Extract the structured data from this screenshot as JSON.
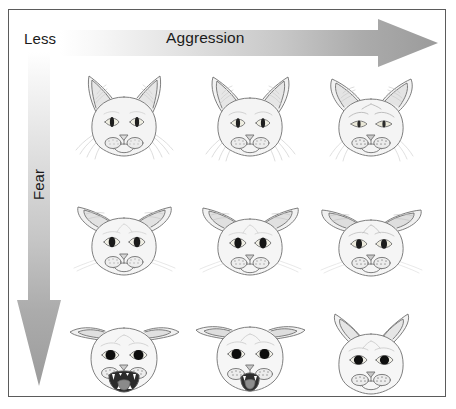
{
  "figure": {
    "type": "cat-emotion-matrix"
  },
  "axes": {
    "horizontal": {
      "start_label": "Less",
      "axis_label": "Aggression",
      "direction": "left-to-right",
      "arrow_name": "aggression-arrow"
    },
    "vertical": {
      "axis_label": "Fear",
      "direction": "top-to-bottom",
      "arrow_name": "fear-arrow"
    }
  },
  "colors": {
    "border": "#5b5b5b",
    "background": "#ffffff",
    "arrow_light": "#fdfdfd",
    "arrow_dark": "#9a9a9a",
    "text": "#1b1b1b",
    "cat_outline": "#6e6e6e",
    "cat_fill": "#f4f4f4",
    "pupil_dark": "#1a1a1a",
    "iris_light": "#eceade"
  },
  "grid": {
    "rows": 3,
    "cols": 3,
    "row_labels": [
      "low-fear",
      "medium-fear",
      "high-fear"
    ],
    "col_labels": [
      "low-aggression",
      "medium-aggression",
      "high-aggression"
    ],
    "cells": [
      {
        "name": "cat-low-fear-low-aggression",
        "row": 0,
        "col": 0,
        "ears": "upright-forward",
        "pupils": "narrow-slit",
        "mouth": "closed",
        "whiskers": "relaxed-spread"
      },
      {
        "name": "cat-low-fear-medium-aggression",
        "row": 0,
        "col": 1,
        "ears": "upright-slightly-rotated",
        "pupils": "narrow-slit",
        "mouth": "closed",
        "whiskers": "forward"
      },
      {
        "name": "cat-low-fear-high-aggression",
        "row": 0,
        "col": 2,
        "ears": "rotated-outward",
        "pupils": "narrow-slit",
        "mouth": "closed",
        "whiskers": "forward-tense"
      },
      {
        "name": "cat-medium-fear-low-aggression",
        "row": 1,
        "col": 0,
        "ears": "turned-sideways",
        "pupils": "oval-dilated",
        "mouth": "closed",
        "whiskers": "back"
      },
      {
        "name": "cat-medium-fear-medium-aggression",
        "row": 1,
        "col": 1,
        "ears": "turned-sideways",
        "pupils": "oval-dilated",
        "mouth": "closed",
        "whiskers": "back"
      },
      {
        "name": "cat-medium-fear-high-aggression",
        "row": 1,
        "col": 2,
        "ears": "rotated-back",
        "pupils": "oval-dilated",
        "mouth": "closed",
        "whiskers": "tense"
      },
      {
        "name": "cat-high-fear-low-aggression",
        "row": 2,
        "col": 0,
        "ears": "flattened-back",
        "pupils": "round-fully-dilated",
        "mouth": "open-hissing",
        "whiskers": "flattened"
      },
      {
        "name": "cat-high-fear-medium-aggression",
        "row": 2,
        "col": 1,
        "ears": "flattened-back",
        "pupils": "round-fully-dilated",
        "mouth": "open-hissing",
        "whiskers": "flattened"
      },
      {
        "name": "cat-high-fear-high-aggression",
        "row": 2,
        "col": 2,
        "ears": "pinned-back",
        "pupils": "round-fully-dilated",
        "mouth": "closed-tense",
        "whiskers": "flattened"
      }
    ]
  }
}
